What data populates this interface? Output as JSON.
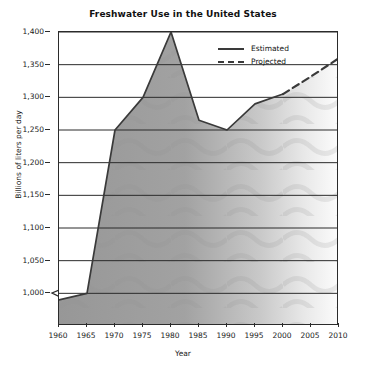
{
  "chart_data": {
    "type": "area",
    "title": "Freshwater Use in the United States",
    "xlabel": "Year",
    "ylabel": "Billions of liters per day",
    "xlim": [
      1960,
      2010
    ],
    "ylim": [
      950,
      1400
    ],
    "y_axis_break": true,
    "grid": true,
    "grid_axis": "y",
    "legend_position": "top-right",
    "x": [
      1960,
      1965,
      1970,
      1975,
      1980,
      1985,
      1990,
      1995,
      2000,
      2005,
      2010
    ],
    "xticks": [
      "1960",
      "1965",
      "1970",
      "1975",
      "1980",
      "1985",
      "1990",
      "1995",
      "2000",
      "2005",
      "2010"
    ],
    "yticks": [
      "1,000",
      "1,050",
      "1,100",
      "1,150",
      "1,200",
      "1,250",
      "1,300",
      "1,350",
      "1,400"
    ],
    "ytick_values": [
      1000,
      1050,
      1100,
      1150,
      1200,
      1250,
      1300,
      1350,
      1400
    ],
    "series": [
      {
        "name": "Estimated",
        "style": "solid",
        "x": [
          1960,
          1965,
          1970,
          1975,
          1980,
          1985,
          1990,
          1995,
          2000
        ],
        "values": [
          990,
          1000,
          1250,
          1300,
          1400,
          1265,
          1250,
          1290,
          1305
        ]
      },
      {
        "name": "Projected",
        "style": "dashed",
        "x": [
          2000,
          2005,
          2010
        ],
        "values": [
          1305,
          1332,
          1360
        ]
      }
    ],
    "legend": [
      {
        "label": "Estimated",
        "style": "solid"
      },
      {
        "label": "Projected",
        "style": "dashed"
      }
    ],
    "colors": {
      "line": "#3a3a3a",
      "fill_left": "#9a9a9a",
      "fill_right": "#fbfbfb",
      "axis": "#2b2b2b",
      "gridline": "#2b2b2b",
      "text": "#1a1a1a"
    }
  }
}
